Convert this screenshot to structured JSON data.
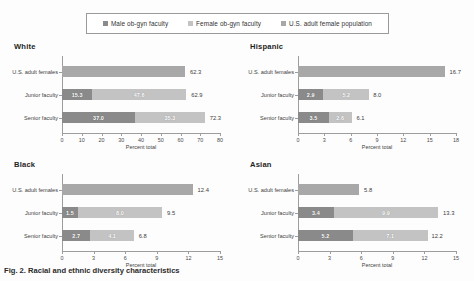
{
  "colors": {
    "male": "#8a8a8a",
    "female": "#c3c3c3",
    "population": "#a8a8a8",
    "axis": "#9d9d9d"
  },
  "legend": {
    "items": [
      {
        "label": "Male ob-gyn faculty",
        "color": "#8a8a8a",
        "icon": "legend-swatch-male"
      },
      {
        "label": "Female ob-gyn faculty",
        "color": "#c3c3c3",
        "icon": "legend-swatch-female"
      },
      {
        "label": "U.S. adult female population",
        "color": "#a8a8a8",
        "icon": "legend-swatch-population"
      }
    ]
  },
  "caption": "Fig. 2. Racial and ethnic diversity characteristics",
  "chart_data": [
    {
      "type": "bar",
      "title": "White",
      "xlabel": "Percent total",
      "ylabel": "",
      "xlim": [
        0,
        80
      ],
      "xticks": [
        0,
        10,
        20,
        30,
        40,
        50,
        60,
        70,
        80
      ],
      "grid": false,
      "legend_position": "top",
      "orientation": "horizontal",
      "stacked": true,
      "categories": [
        "U.S. adult females",
        "Junior faculty",
        "Senior faculty"
      ],
      "series": [
        {
          "name": "Male ob-gyn faculty",
          "values": [
            null,
            15.3,
            37.0
          ]
        },
        {
          "name": "Female ob-gyn faculty",
          "values": [
            null,
            47.6,
            35.3
          ]
        },
        {
          "name": "U.S. adult female population",
          "values": [
            62.3,
            null,
            null
          ]
        }
      ],
      "totals": [
        62.3,
        62.9,
        72.3
      ]
    },
    {
      "type": "bar",
      "title": "Hispanic",
      "xlabel": "Percent total",
      "ylabel": "",
      "xlim": [
        0,
        18
      ],
      "xticks": [
        0,
        3,
        6,
        9,
        12,
        15,
        18
      ],
      "grid": false,
      "legend_position": "top",
      "orientation": "horizontal",
      "stacked": true,
      "categories": [
        "U.S. adult females",
        "Junior faculty",
        "Senior faculty"
      ],
      "series": [
        {
          "name": "Male ob-gyn faculty",
          "values": [
            null,
            2.9,
            3.5
          ]
        },
        {
          "name": "Female ob-gyn faculty",
          "values": [
            null,
            5.2,
            2.6
          ]
        },
        {
          "name": "U.S. adult female population",
          "values": [
            16.7,
            null,
            null
          ]
        }
      ],
      "totals": [
        16.7,
        8.0,
        6.1
      ]
    },
    {
      "type": "bar",
      "title": "Black",
      "xlabel": "Percent total",
      "ylabel": "",
      "xlim": [
        0,
        15
      ],
      "xticks": [
        0,
        3,
        6,
        9,
        12,
        15
      ],
      "grid": false,
      "legend_position": "top",
      "orientation": "horizontal",
      "stacked": true,
      "categories": [
        "U.S. adult females",
        "Junior faculty",
        "Senior faculty"
      ],
      "series": [
        {
          "name": "Male ob-gyn faculty",
          "values": [
            null,
            1.5,
            2.7
          ]
        },
        {
          "name": "Female ob-gyn faculty",
          "values": [
            null,
            8.0,
            4.1
          ]
        },
        {
          "name": "U.S. adult female population",
          "values": [
            12.4,
            null,
            null
          ]
        }
      ],
      "totals": [
        12.4,
        9.5,
        6.8
      ]
    },
    {
      "type": "bar",
      "title": "Asian",
      "xlabel": "Percent total",
      "ylabel": "",
      "xlim": [
        0,
        15
      ],
      "xticks": [
        0,
        3,
        6,
        9,
        12,
        15
      ],
      "grid": false,
      "legend_position": "top",
      "orientation": "horizontal",
      "stacked": true,
      "categories": [
        "U.S. adult females",
        "Junior faculty",
        "Senior faculty"
      ],
      "series": [
        {
          "name": "Male ob-gyn faculty",
          "values": [
            null,
            3.4,
            5.2
          ]
        },
        {
          "name": "Female ob-gyn faculty",
          "values": [
            null,
            9.9,
            7.1
          ]
        },
        {
          "name": "U.S. adult female population",
          "values": [
            5.8,
            null,
            null
          ]
        }
      ],
      "totals": [
        5.8,
        13.3,
        12.2
      ]
    }
  ]
}
